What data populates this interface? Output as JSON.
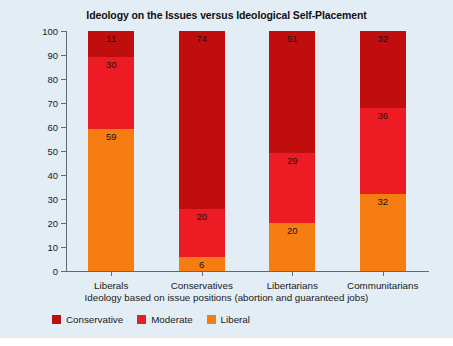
{
  "chart_data": {
    "type": "bar",
    "subtype": "stacked-column-100",
    "title": "Ideology on the Issues versus Ideological Self-Placement",
    "xlabel": "Ideology based on issue positions (abortion and guaranteed jobs)",
    "ylabel": "Percent in each ideological self-placement category",
    "categories": [
      "Liberals",
      "Conservatives",
      "Libertarians",
      "Communitarians"
    ],
    "series": [
      {
        "name": "Conservative",
        "color": "#c00d0d",
        "values": [
          11,
          74,
          51,
          32
        ]
      },
      {
        "name": "Moderate",
        "color": "#ed1c24",
        "values": [
          30,
          20,
          29,
          36
        ]
      },
      {
        "name": "Liberal",
        "color": "#f57d11",
        "values": [
          59,
          6,
          20,
          32
        ]
      }
    ],
    "stack_order_bottom_to_top": [
      "Liberal",
      "Moderate",
      "Conservative"
    ],
    "ylim": [
      0,
      100
    ],
    "yticks": [
      0,
      10,
      20,
      30,
      40,
      50,
      60,
      70,
      80,
      90,
      100
    ],
    "ytick_labels": [
      "0",
      "10",
      "20",
      "30",
      "40",
      "50",
      "60",
      "70",
      "80",
      "90",
      "100"
    ],
    "grid": false,
    "legend_position": "bottom-left",
    "legend_entries": [
      "Conservative",
      "Moderate",
      "Liberal"
    ],
    "data_labels": {
      "Liberals": {
        "Conservative": "11",
        "Moderate": "30",
        "Liberal": "59"
      },
      "Conservatives": {
        "Conservative": "74",
        "Moderate": "20",
        "Liberal": "6"
      },
      "Libertarians": {
        "Conservative": "51",
        "Moderate": "29",
        "Liberal": "20"
      },
      "Communitarians": {
        "Conservative": "32",
        "Moderate": "36",
        "Liberal": "32"
      }
    }
  },
  "figure": {
    "background_color": "#e3edf6",
    "axis_color": "#5d6b78",
    "text_color": "#1a1a1a"
  }
}
